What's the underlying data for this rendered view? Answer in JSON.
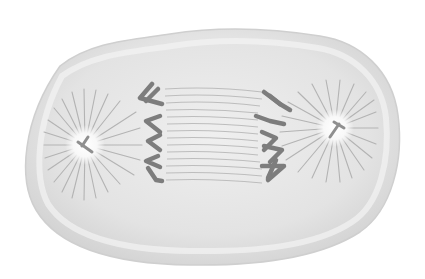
{
  "figure": {
    "alt": "Illustration of a cell during anaphase: sister chromatids pulled toward opposite centrosomes by spindle fibers",
    "colors": {
      "background": "#ffffff",
      "cell_fill": "#e4e4e4",
      "cell_highlight": "#f3f3f3",
      "cell_edge": "#c9c9c9",
      "chromosome": "#7d7d7d",
      "chromosome_light": "#9a9a9a",
      "spindle_fiber": "#bdbdbd",
      "aster_ray": "#b3b3b3",
      "centrosome_glow": "#fafafa",
      "centriole": "#8f8f8f"
    },
    "structures": [
      {
        "name": "cell-membrane"
      },
      {
        "name": "left-centrosome",
        "center": [
          85,
          145
        ]
      },
      {
        "name": "right-centrosome",
        "center": [
          335,
          128
        ]
      },
      {
        "name": "left-chromosome-set",
        "count": 5
      },
      {
        "name": "right-chromosome-set",
        "count": 5
      },
      {
        "name": "spindle-fibers"
      }
    ]
  }
}
